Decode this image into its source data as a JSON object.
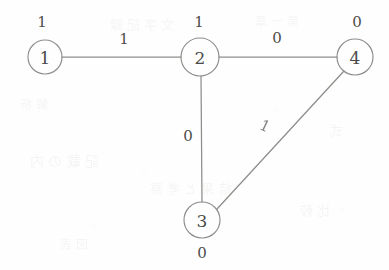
{
  "diagram": {
    "type": "node-link-graph",
    "background_color": "#fefefe",
    "stroke_color": "#8d8d8a",
    "text_color": "#4a4a48"
  },
  "nodes": [
    {
      "id": "1",
      "label": "1",
      "value": "1",
      "value_position": "above",
      "cx": 45,
      "cy": 57,
      "r": 17
    },
    {
      "id": "2",
      "label": "2",
      "value": "1",
      "value_position": "above",
      "cx": 200,
      "cy": 57,
      "r": 19
    },
    {
      "id": "3",
      "label": "3",
      "value": "0",
      "value_position": "below",
      "cx": 202,
      "cy": 220,
      "r": 18
    },
    {
      "id": "4",
      "label": "4",
      "value": "0",
      "value_position": "above",
      "cx": 355,
      "cy": 57,
      "r": 18
    }
  ],
  "edges": [
    {
      "id": "edge-1-2",
      "source": "1",
      "target": "2",
      "weight": "1",
      "label_x": 124,
      "label_y": 39,
      "rotation": 0
    },
    {
      "id": "edge-2-4",
      "source": "2",
      "target": "4",
      "weight": "0",
      "label_x": 277,
      "label_y": 38,
      "rotation": 0
    },
    {
      "id": "edge-2-3",
      "source": "2",
      "target": "3",
      "weight": "0",
      "label_x": 188,
      "label_y": 136,
      "rotation": 0
    },
    {
      "id": "edge-3-4",
      "source": "3",
      "target": "4",
      "weight": "1",
      "label_x": 265,
      "label_y": 126,
      "rotation": 25
    }
  ],
  "ghost_text": [
    {
      "text": "文 字 記 録",
      "x": 110,
      "y": 14,
      "size": 13
    },
    {
      "text": "第 一 章",
      "x": 255,
      "y": 12,
      "size": 12
    },
    {
      "text": "記 載 の 内",
      "x": 30,
      "y": 150,
      "size": 14
    },
    {
      "text": "結 果 と 考 察",
      "x": 150,
      "y": 178,
      "size": 13
    },
    {
      "text": "比 較",
      "x": 300,
      "y": 200,
      "size": 13
    },
    {
      "text": "図 表",
      "x": 60,
      "y": 235,
      "size": 12
    },
    {
      "text": "式",
      "x": 330,
      "y": 120,
      "size": 13
    },
    {
      "text": "解 析",
      "x": 20,
      "y": 95,
      "size": 12
    }
  ]
}
